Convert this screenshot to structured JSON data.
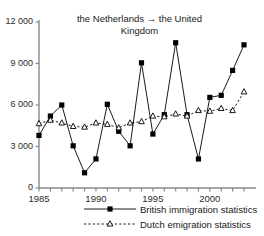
{
  "chart_data": {
    "type": "line",
    "title": "the Netherlands → the United Kingdom",
    "title_line1": "the Netherlands → the United",
    "title_line2": "Kingdom",
    "xlabel": "",
    "ylabel": "",
    "grid": false,
    "legend_position": "bottom",
    "xlim": [
      1985,
      2003
    ],
    "ylim": [
      0,
      12000
    ],
    "yticks": [
      0,
      3000,
      6000,
      9000,
      12000
    ],
    "ytick_labels": [
      "0",
      "3 000",
      "6 000",
      "9 000",
      "12 000"
    ],
    "xticks": [
      1985,
      1986,
      1987,
      1988,
      1989,
      1990,
      1991,
      1992,
      1993,
      1994,
      1995,
      1996,
      1997,
      1998,
      1999,
      2000,
      2001,
      2002,
      2003
    ],
    "xtick_labels_shown": [
      "1985",
      "1990",
      "1995",
      "2000"
    ],
    "xtick_labels_years": [
      1985,
      1990,
      1995,
      2000
    ],
    "x": [
      1985,
      1986,
      1987,
      1988,
      1989,
      1990,
      1991,
      1992,
      1993,
      1994,
      1995,
      1996,
      1997,
      1998,
      1999,
      2000,
      2001,
      2002,
      2003
    ],
    "series": [
      {
        "name": "British immigration statistics",
        "marker": "filled-square",
        "line_style": "solid",
        "color": "#000000",
        "values": [
          3800,
          5200,
          6000,
          3050,
          1100,
          2100,
          6050,
          4100,
          3050,
          9050,
          3900,
          5300,
          10500,
          5300,
          2100,
          6550,
          6700,
          8500,
          10350
        ]
      },
      {
        "name": "Dutch emigration statistics",
        "marker": "open-triangle",
        "line_style": "dashed",
        "color": "#000000",
        "values": [
          4650,
          4900,
          4700,
          4450,
          4400,
          4700,
          4600,
          4350,
          4700,
          4800,
          5200,
          5150,
          5350,
          5200,
          5600,
          5550,
          5750,
          5600,
          6950
        ]
      }
    ],
    "legend": [
      {
        "label": "British immigration statistics",
        "marker": "filled-square",
        "line_style": "solid"
      },
      {
        "label": "Dutch emigration statistics",
        "marker": "open-triangle",
        "line_style": "dashed"
      }
    ]
  }
}
